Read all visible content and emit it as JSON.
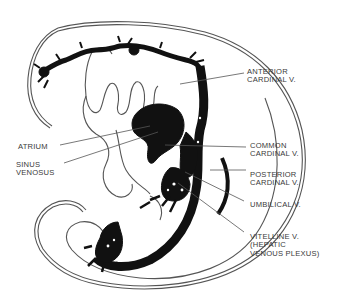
{
  "figure": {
    "colors": {
      "background": "#ffffff",
      "ink": "#111111",
      "outline": "#555555",
      "label": "#3a3a3a"
    }
  },
  "labels": {
    "anterior_cardinal": {
      "line1": "ANTERIOR",
      "line2": "CARDINAL V."
    },
    "atrium": {
      "line1": "ATRIUM"
    },
    "sinus_venosus": {
      "line1": "SINUS",
      "line2": "VENOSUS"
    },
    "common_cardinal": {
      "line1": "COMMON",
      "line2": "CARDINAL V."
    },
    "posterior_cardinal": {
      "line1": "POSTERIOR",
      "line2": "CARDINAL V."
    },
    "umbilical": {
      "line1": "UMBILICAL V."
    },
    "vitelline": {
      "line1": "VITELLINE V.",
      "line2": "(HEPATIC",
      "line3": "VENOUS PLEXUS)"
    }
  }
}
